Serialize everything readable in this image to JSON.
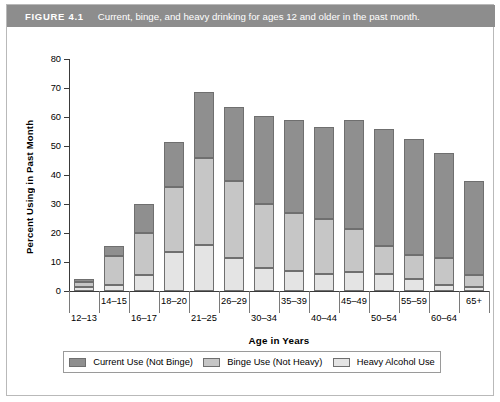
{
  "figure": {
    "label": "FIGURE 4.1",
    "caption": "Current, binge, and heavy drinking for ages 12 and older in the past month."
  },
  "colors": {
    "banner": "#8d8d8d",
    "current_use": "#8f8f8f",
    "binge_use": "#c6c6c6",
    "heavy_use": "#e4e4e4",
    "axis": "#3a3a3a",
    "border": "#b9b9b9"
  },
  "legend": {
    "items": [
      {
        "label": "Current Use (Not Binge)",
        "color": "#8f8f8f",
        "key": "current"
      },
      {
        "label": "Binge Use (Not Heavy)",
        "color": "#c6c6c6",
        "key": "binge"
      },
      {
        "label": "Heavy Alcohol Use",
        "color": "#e4e4e4",
        "key": "heavy"
      }
    ]
  },
  "chart_data": {
    "type": "bar",
    "title": "Current, binge, and heavy drinking for ages 12 and older in the past month.",
    "xlabel": "Age in Years",
    "ylabel": "Percent Using in Past Month",
    "ylim": [
      0,
      80
    ],
    "yticks": [
      0,
      10,
      20,
      30,
      40,
      50,
      60,
      70,
      80
    ],
    "grid": false,
    "stacked": true,
    "legend_position": "bottom",
    "categories": [
      "12–13",
      "14–15",
      "16–17",
      "18–20",
      "21–25",
      "26–29",
      "30–34",
      "35–39",
      "40–44",
      "45–49",
      "50–54",
      "55–59",
      "60–64",
      "65+"
    ],
    "series": [
      {
        "name": "Heavy Alcohol Use",
        "color": "#e4e4e4",
        "values": [
          1.5,
          2.0,
          5.5,
          13.5,
          16.0,
          11.5,
          8.0,
          7.0,
          6.0,
          6.5,
          6.0,
          4.0,
          2.0,
          1.5
        ]
      },
      {
        "name": "Binge Use (Not Heavy)",
        "color": "#c6c6c6",
        "values": [
          1.5,
          10.0,
          14.5,
          22.5,
          30.0,
          26.5,
          22.0,
          20.0,
          19.0,
          15.0,
          9.5,
          8.5,
          9.5,
          4.0
        ]
      },
      {
        "name": "Current Use (Not Binge)",
        "color": "#8f8f8f",
        "values": [
          1.0,
          3.5,
          10.0,
          15.5,
          22.5,
          25.5,
          30.5,
          32.0,
          31.5,
          37.5,
          40.5,
          40.0,
          36.0,
          32.5
        ]
      }
    ],
    "totals": [
      4.0,
      15.5,
      30.0,
      51.5,
      68.5,
      63.5,
      60.5,
      59.0,
      56.5,
      59.0,
      56.0,
      52.5,
      47.5,
      38.0
    ]
  }
}
